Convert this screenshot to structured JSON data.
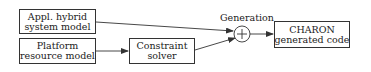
{
  "nodes": {
    "hybrid_model": {
      "line1": "Appl. hybrid",
      "line2": "system model"
    },
    "platform_model": {
      "line1": "Platform",
      "line2": "resource model"
    },
    "constraint_solver": {
      "line1": "Constraint",
      "line2": "solver"
    },
    "generation": {
      "label": "Generation",
      "symbol": "+"
    },
    "charon_code": {
      "line1": "CHARON",
      "line2": "generated code"
    }
  },
  "edges": [
    {
      "from": "hybrid_model",
      "to": "generation"
    },
    {
      "from": "platform_model",
      "to": "constraint_solver"
    },
    {
      "from": "constraint_solver",
      "to": "generation"
    },
    {
      "from": "generation",
      "to": "charon_code"
    }
  ]
}
